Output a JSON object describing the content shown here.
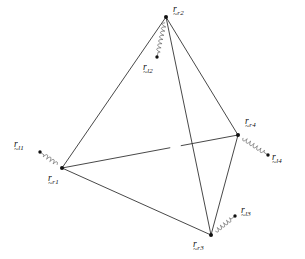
{
  "figure": {
    "kind": "tetrahedron-vector-diagram",
    "width": 305,
    "height": 259,
    "background_color": "#ffffff",
    "line_color": "#333333",
    "node_color": "#111111",
    "spring_color": "#555555",
    "caption": "",
    "nodes": [
      {
        "id": "r_r2",
        "base": "r",
        "subscript": "r2",
        "x": 166,
        "y": 17,
        "label_x": 173,
        "label_y": 5,
        "type": "rigid-vertex"
      },
      {
        "id": "r_r1",
        "base": "r",
        "subscript": "r1",
        "x": 62,
        "y": 168,
        "label_x": 48,
        "label_y": 174,
        "type": "rigid-vertex"
      },
      {
        "id": "r_r4",
        "base": "r",
        "subscript": "r4",
        "x": 238,
        "y": 135,
        "label_x": 245,
        "label_y": 117,
        "type": "rigid-vertex"
      },
      {
        "id": "r_r3",
        "base": "r",
        "subscript": "r3",
        "x": 211,
        "y": 235,
        "label_x": 193,
        "label_y": 240,
        "type": "rigid-vertex"
      },
      {
        "id": "r_l2",
        "base": "r",
        "subscript": "l2",
        "x": 157,
        "y": 57,
        "label_x": 143,
        "label_y": 63,
        "type": "linked-point"
      },
      {
        "id": "r_l1",
        "base": "r",
        "subscript": "l1",
        "x": 40,
        "y": 152,
        "label_x": 14,
        "label_y": 140,
        "type": "linked-point"
      },
      {
        "id": "r_l4",
        "base": "r",
        "subscript": "l4",
        "x": 268,
        "y": 155,
        "label_x": 272,
        "label_y": 153,
        "type": "linked-point"
      },
      {
        "id": "r_l3",
        "base": "r",
        "subscript": "l3",
        "x": 235,
        "y": 216,
        "label_x": 241,
        "label_y": 206,
        "type": "linked-point"
      }
    ],
    "edges": [
      {
        "from": "r_r2",
        "to": "r_r1",
        "style": "solid"
      },
      {
        "from": "r_r2",
        "to": "r_r4",
        "style": "solid"
      },
      {
        "from": "r_r2",
        "to": "r_r3",
        "style": "solid"
      },
      {
        "from": "r_r1",
        "to": "r_r3",
        "style": "solid"
      },
      {
        "from": "r_r4",
        "to": "r_r3",
        "style": "solid"
      },
      {
        "from": "r_r1",
        "to": "r_r4",
        "style": "solid-occluded"
      }
    ],
    "springs": [
      {
        "from": "r_r2",
        "to": "r_l2"
      },
      {
        "from": "r_r1",
        "to": "r_l1"
      },
      {
        "from": "r_r4",
        "to": "r_l4"
      },
      {
        "from": "r_r3",
        "to": "r_l3"
      }
    ]
  }
}
